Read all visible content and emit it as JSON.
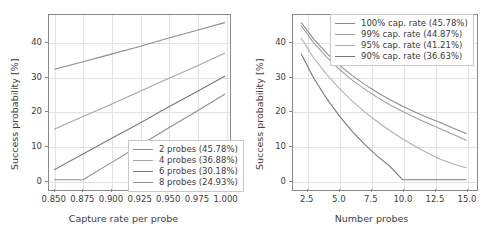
{
  "chart_data": [
    {
      "type": "line",
      "panel": "left",
      "title": "",
      "xlabel": "Capture rate per probe",
      "ylabel": "Success probability [%]",
      "xlim": [
        0.845,
        1.003
      ],
      "ylim": [
        -2.4,
        48.0
      ],
      "xticks": [
        "0.850",
        "0.875",
        "0.900",
        "0.925",
        "0.950",
        "0.975",
        "1.000"
      ],
      "xtick_values": [
        0.85,
        0.875,
        0.9,
        0.925,
        0.95,
        0.975,
        1.0
      ],
      "yticks": [
        "0",
        "10",
        "20",
        "30",
        "40"
      ],
      "ytick_values": [
        0,
        10,
        20,
        30,
        40
      ],
      "grid": true,
      "legend_position": "lower right",
      "series": [
        {
          "name": "2 probes (45.78%)",
          "color": "#8c8c8c",
          "x": [
            0.85,
            0.875,
            0.9,
            0.925,
            0.95,
            0.975,
            1.0
          ],
          "y": [
            32.2,
            34.4,
            36.6,
            38.8,
            41.2,
            43.5,
            45.78
          ]
        },
        {
          "name": "4 probes (36.88%)",
          "color": "#a6a6a6",
          "x": [
            0.85,
            0.875,
            0.9,
            0.925,
            0.95,
            0.975,
            1.0
          ],
          "y": [
            14.8,
            18.4,
            22.0,
            25.7,
            29.4,
            33.1,
            36.88
          ]
        },
        {
          "name": "6 probes (30.18%)",
          "color": "#7a7a7a",
          "x": [
            0.85,
            0.875,
            0.9,
            0.925,
            0.95,
            0.975,
            1.0
          ],
          "y": [
            3.0,
            7.5,
            12.0,
            16.5,
            21.1,
            25.6,
            30.18
          ]
        },
        {
          "name": "8 probes (24.93%)",
          "color": "#909090",
          "x": [
            0.85,
            0.875,
            0.9,
            0.925,
            0.95,
            0.975,
            1.0
          ],
          "y": [
            0.0,
            0.0,
            5.0,
            10.0,
            15.0,
            19.9,
            24.93
          ]
        }
      ]
    },
    {
      "type": "line",
      "panel": "right",
      "title": "",
      "xlabel": "Number probes",
      "ylabel": "Success probability [%]",
      "xlim": [
        1.35,
        15.7
      ],
      "ylim": [
        -2.4,
        48.0
      ],
      "xticks": [
        "2.5",
        "5.0",
        "7.5",
        "10.0",
        "12.5",
        "15.0"
      ],
      "xtick_values": [
        2.5,
        5.0,
        7.5,
        10.0,
        12.5,
        15.0
      ],
      "yticks": [
        "0",
        "10",
        "20",
        "30",
        "40"
      ],
      "ytick_values": [
        0,
        10,
        20,
        30,
        40
      ],
      "grid": true,
      "legend_position": "upper right",
      "series": [
        {
          "name": "100% cap. rate (45.78%)",
          "color": "#8c8c8c",
          "x": [
            2,
            3,
            4,
            5,
            6,
            7,
            8,
            9,
            10,
            11,
            12,
            13,
            14,
            15
          ],
          "y": [
            45.78,
            40.9,
            36.9,
            33.4,
            30.4,
            27.8,
            25.4,
            23.3,
            21.4,
            19.7,
            18.1,
            16.6,
            15.0,
            13.5
          ]
        },
        {
          "name": "99% cap. rate (44.87%)",
          "color": "#a0a0a0",
          "x": [
            2,
            3,
            4,
            5,
            6,
            7,
            8,
            9,
            10,
            11,
            12,
            13,
            14,
            15
          ],
          "y": [
            44.87,
            39.8,
            35.8,
            32.2,
            29.1,
            26.4,
            24.0,
            21.8,
            19.9,
            18.1,
            16.4,
            14.8,
            13.2,
            11.5
          ]
        },
        {
          "name": "95% cap. rate (41.21%)",
          "color": "#b0b0b0",
          "x": [
            2,
            3,
            4,
            5,
            6,
            7,
            8,
            9,
            10,
            11,
            12,
            13,
            14,
            15
          ],
          "y": [
            41.21,
            35.4,
            30.7,
            26.6,
            23.0,
            19.8,
            16.9,
            14.3,
            11.9,
            9.7,
            7.7,
            5.9,
            4.6,
            3.5
          ]
        },
        {
          "name": "90% cap. rate (36.63%)",
          "color": "#787878",
          "x": [
            2,
            3,
            4,
            5,
            6,
            7,
            8,
            9,
            10,
            11,
            12,
            13,
            14,
            15
          ],
          "y": [
            36.63,
            29.5,
            23.7,
            18.6,
            14.2,
            10.3,
            6.9,
            3.9,
            0.0,
            0.0,
            0.0,
            0.0,
            0.0,
            0.0
          ]
        }
      ]
    }
  ]
}
